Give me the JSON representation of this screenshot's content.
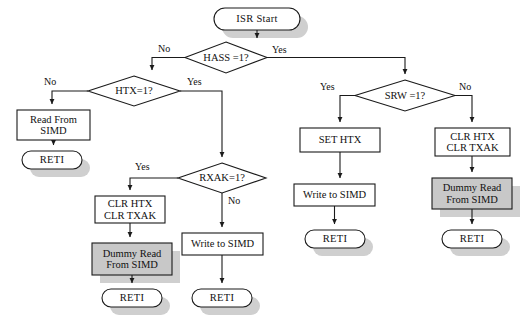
{
  "diagram": {
    "style": {
      "stroke": "#1a1a1a",
      "box_fill": "#ffffff",
      "shaded_fill": "#c8c8c8",
      "shadow": "#cfcfcf",
      "text": "#111111"
    },
    "nodes": [
      {
        "id": "isr-start",
        "type": "terminator",
        "label": "ISR Start",
        "shaded": false,
        "x": 214,
        "y": 8,
        "w": 86,
        "h": 22
      },
      {
        "id": "hass-decision",
        "type": "decision",
        "label": "HASS =1?",
        "shaded": false,
        "x": 185,
        "y": 42,
        "w": 82,
        "h": 31
      },
      {
        "id": "htx-decision",
        "type": "decision",
        "label": "HTX=1?",
        "shaded": false,
        "x": 88,
        "y": 76,
        "w": 92,
        "h": 30
      },
      {
        "id": "read-from-simd",
        "type": "process",
        "label": "Read From\nSIMD",
        "shaded": false,
        "x": 17,
        "y": 110,
        "w": 73,
        "h": 30
      },
      {
        "id": "reti-left",
        "type": "terminator",
        "label": "RETI",
        "shaded": false,
        "x": 22,
        "y": 151,
        "w": 60,
        "h": 18
      },
      {
        "id": "rxak-decision",
        "type": "decision",
        "label": "RXAK=1?",
        "shaded": false,
        "x": 178,
        "y": 163,
        "w": 88,
        "h": 30
      },
      {
        "id": "clr-htx-txak-mid",
        "type": "process",
        "label": "CLR HTX\nCLR TXAK",
        "shaded": false,
        "x": 95,
        "y": 196,
        "w": 70,
        "h": 27
      },
      {
        "id": "dummy-read-mid",
        "type": "process",
        "label": "Dummy Read\nFrom SIMD",
        "shaded": true,
        "x": 92,
        "y": 243,
        "w": 80,
        "h": 32
      },
      {
        "id": "reti-mid-left",
        "type": "terminator",
        "label": "RETI",
        "shaded": false,
        "x": 102,
        "y": 289,
        "w": 60,
        "h": 18
      },
      {
        "id": "write-to-simd-mid",
        "type": "process",
        "label": "Write to SIMD",
        "shaded": false,
        "x": 182,
        "y": 233,
        "w": 81,
        "h": 22
      },
      {
        "id": "reti-mid-right",
        "type": "terminator",
        "label": "RETI",
        "shaded": false,
        "x": 192,
        "y": 289,
        "w": 60,
        "h": 18
      },
      {
        "id": "srw-decision",
        "type": "decision",
        "label": "SRW =1?",
        "shaded": false,
        "x": 355,
        "y": 80,
        "w": 100,
        "h": 31
      },
      {
        "id": "set-htx",
        "type": "process",
        "label": "SET HTX",
        "shaded": false,
        "x": 300,
        "y": 128,
        "w": 80,
        "h": 24
      },
      {
        "id": "write-to-simd-rt",
        "type": "process",
        "label": "Write to SIMD",
        "shaded": false,
        "x": 294,
        "y": 184,
        "w": 81,
        "h": 22
      },
      {
        "id": "reti-right-a",
        "type": "terminator",
        "label": "RETI",
        "shaded": false,
        "x": 305,
        "y": 230,
        "w": 60,
        "h": 18
      },
      {
        "id": "clr-htx-txak-rt",
        "type": "process",
        "label": "CLR HTX\nCLR TXAK",
        "shaded": false,
        "x": 435,
        "y": 128,
        "w": 75,
        "h": 28
      },
      {
        "id": "dummy-read-rt",
        "type": "process",
        "label": "Dummy Read\nFrom SIMD",
        "shaded": true,
        "x": 432,
        "y": 178,
        "w": 80,
        "h": 31
      },
      {
        "id": "reti-right-b",
        "type": "terminator",
        "label": "RETI",
        "shaded": false,
        "x": 442,
        "y": 230,
        "w": 60,
        "h": 18
      }
    ],
    "edge_labels": [
      {
        "id": "hass-no",
        "text": "No",
        "x": 158,
        "y": 43
      },
      {
        "id": "hass-yes",
        "text": "Yes",
        "x": 272,
        "y": 44
      },
      {
        "id": "htx-no",
        "text": "No",
        "x": 44,
        "y": 76
      },
      {
        "id": "htx-yes",
        "text": "Yes",
        "x": 187,
        "y": 76
      },
      {
        "id": "rxak-yes",
        "text": "Yes",
        "x": 135,
        "y": 161
      },
      {
        "id": "rxak-no",
        "text": "No",
        "x": 228,
        "y": 195
      },
      {
        "id": "srw-yes",
        "text": "Yes",
        "x": 320,
        "y": 81
      },
      {
        "id": "srw-no",
        "text": "No",
        "x": 459,
        "y": 81
      }
    ]
  }
}
